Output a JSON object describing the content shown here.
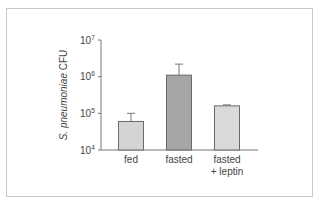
{
  "chart_data": {
    "type": "bar",
    "title": "",
    "xlabel": "",
    "ylabel": "S. pneumoniae CFU",
    "yscale": "log",
    "ylim": [
      10000,
      10000000
    ],
    "yticks": [
      {
        "base": "10",
        "exp": "4",
        "value": 10000
      },
      {
        "base": "10",
        "exp": "5",
        "value": 100000
      },
      {
        "base": "10",
        "exp": "6",
        "value": 1000000
      },
      {
        "base": "10",
        "exp": "7",
        "value": 10000000
      }
    ],
    "categories": [
      "fed",
      "fasted",
      "fasted\n+ leptin"
    ],
    "category_lines": [
      [
        "fed"
      ],
      [
        "fasted"
      ],
      [
        "fasted",
        "+ leptin"
      ]
    ],
    "values": [
      60000,
      1100000,
      160000
    ],
    "error_upper": [
      100000,
      2200000,
      170000
    ],
    "bar_colors": [
      "#d4d4d4",
      "#a6a6a6",
      "#d9d9d9"
    ],
    "grid": false,
    "legend": null
  },
  "axis": {
    "ylabel_prefix": "S. pneumoniae",
    "ylabel_suffix": " CFU"
  }
}
